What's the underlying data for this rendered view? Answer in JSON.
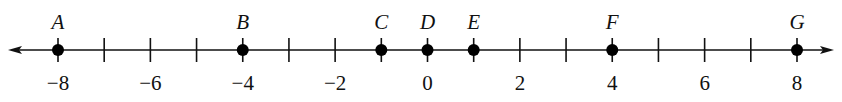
{
  "number_line": {
    "min": -8,
    "max": 8,
    "tick_step": 1,
    "label_step": 2,
    "tick_labels": [
      "-8",
      "-6",
      "-4",
      "-2",
      "0",
      "2",
      "4",
      "6",
      "8"
    ],
    "arrows": [
      "left",
      "right"
    ],
    "points": [
      {
        "label": "A",
        "value": -8
      },
      {
        "label": "B",
        "value": -4
      },
      {
        "label": "C",
        "value": -1
      },
      {
        "label": "D",
        "value": 0
      },
      {
        "label": "E",
        "value": 1
      },
      {
        "label": "F",
        "value": 4
      },
      {
        "label": "G",
        "value": 8
      }
    ],
    "colors": {
      "line": "#111111",
      "point": "#000000"
    }
  }
}
